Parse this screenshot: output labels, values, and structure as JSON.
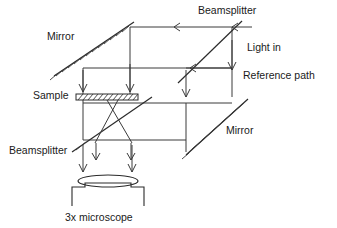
{
  "figure": {
    "background_color": "#ffffff",
    "line_color": "#3a3a3a",
    "text_color": "#1a1a1a",
    "width": 337,
    "height": 228
  },
  "labels": {
    "mirror_top": "Mirror",
    "beamsplitter_top": "Beamsplitter",
    "light_in": "Light in",
    "reference_path": "Reference path",
    "sample": "Sample",
    "mirror_bottom": "Mirror",
    "beamsplitter_bottom": "Beamsplitter",
    "microscope": "3x microscope"
  },
  "components": [
    {
      "name": "mirror-top-left",
      "type": "mirror",
      "label": "Mirror",
      "hatched": true,
      "orientation": "diagonal"
    },
    {
      "name": "beamsplitter-top-right",
      "type": "beamsplitter",
      "label": "Beamsplitter",
      "hatched": false,
      "orientation": "diagonal"
    },
    {
      "name": "sample-plate",
      "type": "sample",
      "label": "Sample",
      "hatched": true,
      "orientation": "horizontal"
    },
    {
      "name": "mirror-bottom-right",
      "type": "mirror",
      "label": "Mirror",
      "hatched": true,
      "orientation": "diagonal"
    },
    {
      "name": "beamsplitter-lower-left",
      "type": "beamsplitter",
      "label": "Beamsplitter",
      "hatched": false,
      "orientation": "diagonal"
    },
    {
      "name": "microscope-objective",
      "type": "lens",
      "label": "3x microscope",
      "hatched": false,
      "orientation": "horizontal"
    }
  ],
  "beam_paths": [
    {
      "name": "light-in-entry",
      "from": "Light in",
      "to": "beamsplitter-top-right",
      "direction": "leftward"
    },
    {
      "name": "top-transfer",
      "from": "beamsplitter-top-right",
      "to": "mirror-top-left",
      "direction": "leftward"
    },
    {
      "name": "reference-path-beam",
      "from": "Light in",
      "to": "Reference path",
      "direction": "leftward"
    },
    {
      "name": "sample-illumination",
      "from": "mirror-top-left",
      "to": "sample-plate",
      "direction": "downward"
    },
    {
      "name": "output-to-microscope",
      "from": "beamsplitter-lower-left",
      "to": "microscope-objective",
      "direction": "downward"
    }
  ]
}
